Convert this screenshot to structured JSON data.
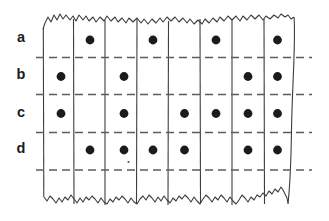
{
  "figure": {
    "type": "punched-tape-dot-grid",
    "column_count": 8,
    "row_labels": [
      "a",
      "b",
      "c",
      "d"
    ],
    "rows": [
      {
        "label": "a",
        "dots": [
          0,
          1,
          0,
          1,
          0,
          1,
          0,
          1
        ]
      },
      {
        "label": "b",
        "dots": [
          1,
          0,
          1,
          0,
          0,
          0,
          1,
          1
        ]
      },
      {
        "label": "c",
        "dots": [
          1,
          0,
          1,
          0,
          1,
          1,
          1,
          1
        ]
      },
      {
        "label": "d",
        "dots": [
          0,
          1,
          1,
          1,
          1,
          0,
          1,
          1
        ]
      }
    ],
    "colors": {
      "background": "#ffffff",
      "ink": "#1b1b1b",
      "grid_line": "#3d3d3d",
      "dashed_line": "#5c5c5c"
    }
  }
}
